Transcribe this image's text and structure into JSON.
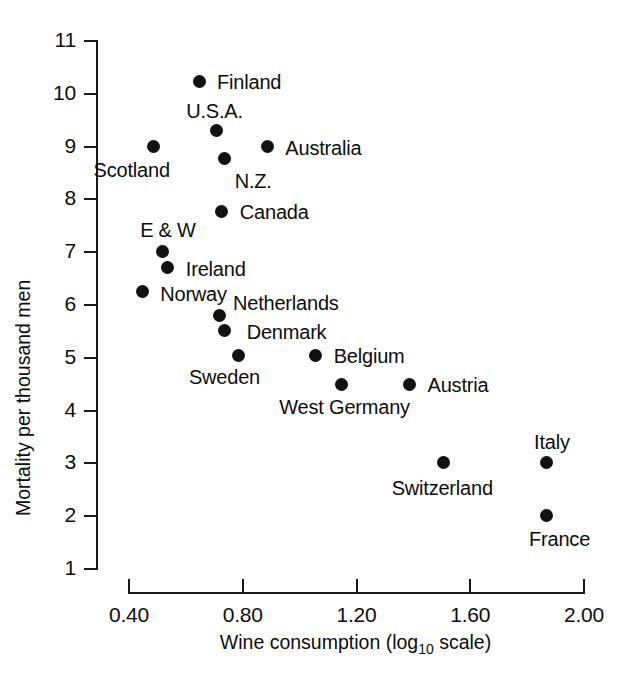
{
  "chart_data": {
    "type": "scatter",
    "title": "",
    "xlabel": "Wine consumption (log10 scale)",
    "xlabel_pre": "Wine consumption (log",
    "xlabel_sub": "10",
    "xlabel_post": " scale)",
    "ylabel": "Mortality per thousand men",
    "xlim": [
      0.4,
      2.0
    ],
    "ylim": [
      1,
      11
    ],
    "xticks": [
      "0.40",
      "0.80",
      "1.20",
      "1.60",
      "2.00"
    ],
    "xtick_values": [
      0.4,
      0.8,
      1.2,
      1.6,
      2.0
    ],
    "yticks": [
      "11",
      "10",
      "9",
      "8",
      "7",
      "6",
      "5",
      "4",
      "3",
      "2",
      "1"
    ],
    "ytick_values": [
      11,
      10,
      9,
      8,
      7,
      6,
      5,
      4,
      3,
      2,
      1
    ],
    "grid": false,
    "legend": "none",
    "marker_color": "#111111",
    "points": [
      {
        "label": "Finland",
        "x": 0.65,
        "y": 10.22,
        "lx": 18,
        "ly": -9
      },
      {
        "label": "U.S.A.",
        "x": 0.71,
        "y": 9.28,
        "lx": -30,
        "ly": -30
      },
      {
        "label": "Australia",
        "x": 0.89,
        "y": 8.98,
        "lx": 18,
        "ly": -9
      },
      {
        "label": "Scotland",
        "x": 0.49,
        "y": 8.98,
        "lx": -60,
        "ly": 13
      },
      {
        "label": "N.Z.",
        "x": 0.74,
        "y": 8.75,
        "lx": 10,
        "ly": 12
      },
      {
        "label": "Canada",
        "x": 0.73,
        "y": 7.76,
        "lx": 18,
        "ly": -9
      },
      {
        "label": "E & W",
        "x": 0.52,
        "y": 7.0,
        "lx": -22,
        "ly": -31
      },
      {
        "label": "Ireland",
        "x": 0.54,
        "y": 6.7,
        "lx": 18,
        "ly": -8
      },
      {
        "label": "Norway",
        "x": 0.45,
        "y": 6.23,
        "lx": 18,
        "ly": -8
      },
      {
        "label": "Netherlands",
        "x": 0.72,
        "y": 5.78,
        "lx": 14,
        "ly": -23
      },
      {
        "label": "Denmark",
        "x": 0.74,
        "y": 5.49,
        "lx": 22,
        "ly": -9
      },
      {
        "label": "Sweden",
        "x": 0.79,
        "y": 5.03,
        "lx": -50,
        "ly": 12
      },
      {
        "label": "Belgium",
        "x": 1.06,
        "y": 5.03,
        "lx": 18,
        "ly": -9
      },
      {
        "label": "West Germany",
        "x": 1.15,
        "y": 4.48,
        "lx": -62,
        "ly": 13
      },
      {
        "label": "Austria",
        "x": 1.39,
        "y": 4.48,
        "lx": 18,
        "ly": -9
      },
      {
        "label": "Switzerland",
        "x": 1.51,
        "y": 3.0,
        "lx": -52,
        "ly": 16
      },
      {
        "label": "Italy",
        "x": 1.87,
        "y": 3.0,
        "lx": -12,
        "ly": -30
      },
      {
        "label": "France",
        "x": 1.87,
        "y": 2.0,
        "lx": -17,
        "ly": 14
      }
    ]
  }
}
